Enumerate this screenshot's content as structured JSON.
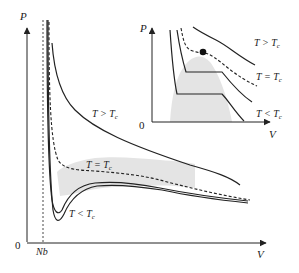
{
  "diagram": {
    "main_plot": {
      "y_axis_label": "P",
      "x_axis_label": "V",
      "origin_label": "0",
      "asymptote_label": "Nb",
      "curves": [
        {
          "id": "above-critical",
          "label": "T > T",
          "subscript": "c",
          "style": "solid"
        },
        {
          "id": "critical",
          "label": "T = T",
          "subscript": "c",
          "style": "dashed"
        },
        {
          "id": "below-critical",
          "label": "T < T",
          "subscript": "c",
          "style": "solid-double"
        }
      ],
      "colors": {
        "line": "#222222",
        "shade": "#e4e4e4",
        "background": "#ffffff"
      }
    },
    "inset_plot": {
      "y_axis_label": "P",
      "x_axis_label": "V",
      "origin_label": "0",
      "critical_point": "filled-dot",
      "curves": [
        {
          "id": "inset-above-critical",
          "label": "T > T",
          "subscript": "c",
          "style": "solid"
        },
        {
          "id": "inset-critical",
          "label": "T = T",
          "subscript": "c",
          "style": "dashed"
        },
        {
          "id": "inset-below-critical",
          "label": "T < T",
          "subscript": "c",
          "style": "solid"
        }
      ]
    }
  }
}
